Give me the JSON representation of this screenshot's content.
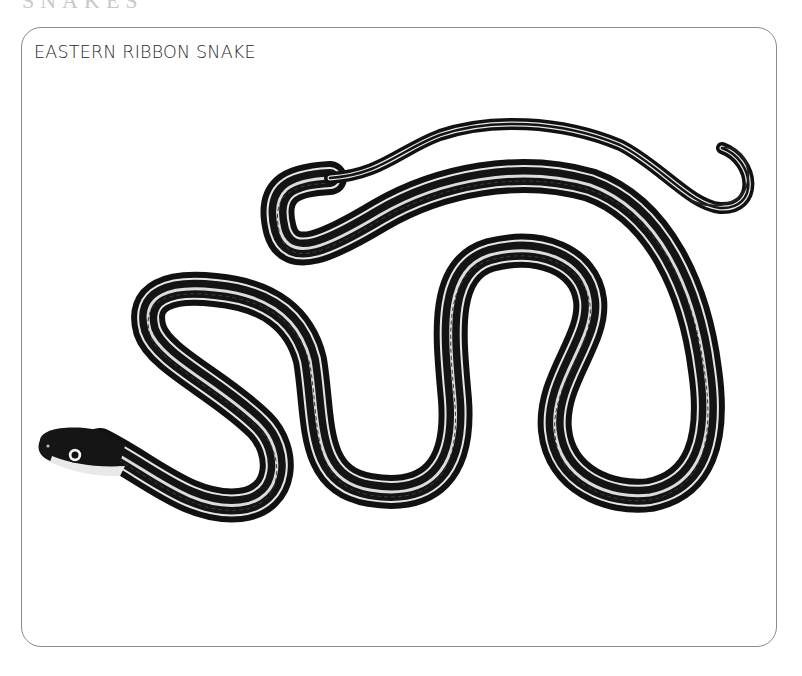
{
  "header_clipped": {
    "text": "SNAKES"
  },
  "card": {
    "title": "EASTERN RIBBON SNAKE"
  },
  "illustration": {
    "subject": "Eastern ribbon snake",
    "style": "black-and-white engraving",
    "colors": {
      "body": "#111111",
      "stripe": "#e6e6e6",
      "border": "#8a8a8a"
    }
  }
}
